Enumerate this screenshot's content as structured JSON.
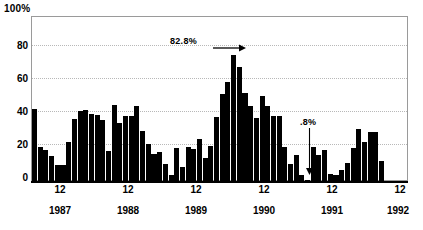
{
  "chart_data": {
    "type": "bar",
    "title": "",
    "xlabel": "",
    "ylabel": "",
    "ylim": [
      0,
      100
    ],
    "yticks": [
      0,
      20,
      40,
      60,
      80
    ],
    "ytick_labels": [
      "0",
      "20",
      "40",
      "60",
      "80"
    ],
    "y_top_label": "100%",
    "grid": "horizontal-dotted",
    "legend": "none",
    "bar_color": "#000000",
    "categories": [
      "1987-01",
      "1987-02",
      "1987-03",
      "1987-04",
      "1987-05",
      "1987-06",
      "1987-07",
      "1987-08",
      "1987-09",
      "1987-10",
      "1987-11",
      "1987-12",
      "1988-01",
      "1988-02",
      "1988-03",
      "1988-04",
      "1988-05",
      "1988-06",
      "1988-07",
      "1988-08",
      "1988-09",
      "1988-10",
      "1988-11",
      "1988-12",
      "1989-01",
      "1989-02",
      "1989-03",
      "1989-04",
      "1989-05",
      "1989-06",
      "1989-07",
      "1989-08",
      "1989-09",
      "1989-10",
      "1989-11",
      "1989-12",
      "1990-01",
      "1990-02",
      "1990-03",
      "1990-04",
      "1990-05",
      "1990-06",
      "1990-07",
      "1990-08",
      "1990-09",
      "1990-10",
      "1990-11",
      "1990-12",
      "1991-01",
      "1991-02",
      "1991-03",
      "1991-04",
      "1991-05",
      "1991-06",
      "1991-07",
      "1991-08",
      "1991-09",
      "1991-10",
      "1991-11",
      "1991-12",
      "1992-01",
      "1992-02",
      "1992-03",
      "1992-04",
      "1992-05",
      "1992-06"
    ],
    "values": [
      44,
      21,
      19,
      15.5,
      10,
      10,
      24,
      38,
      42.5,
      43.5,
      41,
      40.5,
      37.5,
      18.5,
      46.5,
      35.5,
      39.5,
      39.5,
      45.5,
      30.5,
      22.5,
      16.5,
      17.5,
      10.5,
      3.5,
      20,
      8.5,
      20.5,
      19.5,
      25.5,
      14,
      21.5,
      39,
      53,
      60.5,
      77,
      69.5,
      53.5,
      46,
      38.5,
      52,
      45.5,
      39.5,
      39.5,
      21,
      10.5,
      16,
      3.5,
      0.8,
      20.5,
      16,
      19,
      4.5,
      3.5,
      7,
      11,
      20,
      32,
      24,
      30,
      30,
      12,
      0,
      0,
      0,
      0
    ],
    "xtick_labels": [
      "12",
      "12",
      "12",
      "12",
      "12",
      "12"
    ],
    "xyear_labels": [
      "1987",
      "1988",
      "1989",
      "1990",
      "1991",
      "1992"
    ],
    "annotations": [
      {
        "name": "peak",
        "text": "82.8%",
        "arrow": "right-arrow-icon",
        "points_to": "1989-12"
      },
      {
        "name": "trough",
        "text": ".8%",
        "arrow": "down-arrow-icon",
        "points_to": "1991-01"
      }
    ]
  }
}
